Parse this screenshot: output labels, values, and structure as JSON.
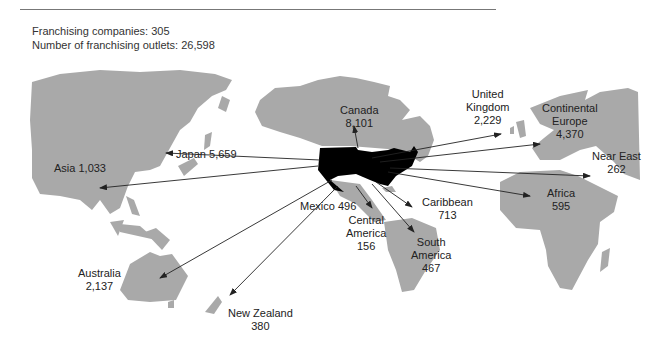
{
  "header": {
    "companies": "Franchising companies: 305",
    "outlets": "Number of franchising outlets: 26,598"
  },
  "colors": {
    "land": "#a9a9a9",
    "usa": "#000000",
    "arrow": "#222222",
    "rule": "#777777"
  },
  "regions": [
    {
      "name": "Canada",
      "value": "8,101"
    },
    {
      "name": "United Kingdom",
      "value": "2,229"
    },
    {
      "name": "Continental Europe",
      "value": "4,370"
    },
    {
      "name": "Near East",
      "value": "262"
    },
    {
      "name": "Africa",
      "value": "595"
    },
    {
      "name": "Caribbean",
      "value": "713"
    },
    {
      "name": "South America",
      "value": "467"
    },
    {
      "name": "Central America",
      "value": "156"
    },
    {
      "name": "Mexico",
      "value": "496"
    },
    {
      "name": "Japan",
      "value": "5,659"
    },
    {
      "name": "Asia",
      "value": "1,033"
    },
    {
      "name": "Australia",
      "value": "2,137"
    },
    {
      "name": "New Zealand",
      "value": "380"
    }
  ],
  "labels": {
    "canada": [
      "Canada",
      "8,101"
    ],
    "uk": [
      "United",
      "Kingdom",
      "2,229"
    ],
    "europe": [
      "Continental",
      "Europe",
      "4,370"
    ],
    "neareast": [
      "Near East",
      "262"
    ],
    "africa": [
      "Africa",
      "595"
    ],
    "caribbean": [
      "Caribbean",
      "713"
    ],
    "southamerica": [
      "South",
      "America",
      "467"
    ],
    "centralamerica": [
      "Central",
      "America",
      "156"
    ],
    "mexico": "Mexico 496",
    "japan": "Japan 5,659",
    "asia": "Asia 1,033",
    "australia": [
      "Australia",
      "2,137"
    ],
    "newzealand": [
      "New Zealand",
      "380"
    ]
  }
}
